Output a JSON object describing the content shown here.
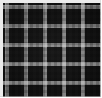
{
  "image": {
    "kind": "texture-swatch",
    "subject": "gingham-checkered-fabric",
    "alt_text": "Black and white gingham checkered fabric weave",
    "width_px": 101,
    "height_px": 97,
    "caption": ""
  },
  "pattern": {
    "name": "gingham",
    "cell_size_px": 9.5,
    "repeat_px": 19,
    "columns": 10,
    "rows": 10,
    "tones": 3,
    "tone_labels": [
      "light",
      "mid",
      "dark"
    ],
    "orientation": "orthogonal"
  },
  "colors": {
    "dark": "#0d0d0d",
    "mid": "#6e6e6e",
    "light": "#e8e8e8",
    "edge": "#ebebeb",
    "background": "#ffffff"
  },
  "edges": {
    "top_selvedge_px": 2.5,
    "left_selvedge_px": 2.5,
    "bottom_selvedge_px": 1.5,
    "right_selvedge_px": 1.5
  },
  "texture": {
    "thread_pitch_px": 1.2,
    "weave": "plain",
    "noise": "low"
  }
}
